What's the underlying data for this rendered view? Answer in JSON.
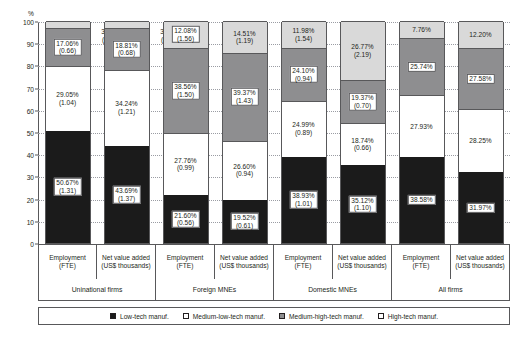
{
  "chart_data": {
    "type": "bar",
    "subtype": "stacked-100-percent",
    "title": "",
    "xlabel": "",
    "ylabel": "%",
    "ylim": [
      0,
      100
    ],
    "yticks": [
      0,
      10,
      20,
      30,
      40,
      50,
      60,
      70,
      80,
      90,
      100
    ],
    "grid": true,
    "legend_position": "bottom",
    "legend": [
      {
        "key": "low",
        "label": "Low-tech manuf.",
        "color": "#1b1b1b"
      },
      {
        "key": "medlow",
        "label": "Medium-low-tech manuf.",
        "color": "#ffffff"
      },
      {
        "key": "medhigh",
        "label": "Medium-high-tech manuf.",
        "color": "#8e8e90"
      },
      {
        "key": "high",
        "label": "High-tech manuf.",
        "color": "#d9d9d9"
      }
    ],
    "groups": [
      {
        "label": "Uninational firms"
      },
      {
        "label": "Foreign MNEs"
      },
      {
        "label": "Domestic MNEs"
      },
      {
        "label": "All firms"
      }
    ],
    "categories": [
      {
        "line1": "Employment",
        "line2": "(FTE)"
      },
      {
        "line1": "Net value added",
        "line2": "(US$ thousands)"
      },
      {
        "line1": "Employment",
        "line2": "(FTE)"
      },
      {
        "line1": "Net value added",
        "line2": "(US$ thousands)"
      },
      {
        "line1": "Employment",
        "line2": "(FTE)"
      },
      {
        "line1": "Net value added",
        "line2": "(US$ thousands)"
      },
      {
        "line1": "Employment",
        "line2": "(FTE)"
      },
      {
        "line1": "Net value added",
        "line2": "(US$ thousands)"
      }
    ],
    "series": [
      {
        "name": "Low-tech manuf.",
        "values": [
          50.67,
          43.69,
          21.6,
          19.52,
          38.93,
          35.12,
          38.58,
          31.97
        ]
      },
      {
        "name": "Medium-low-tech manuf.",
        "values": [
          29.05,
          34.24,
          27.76,
          26.6,
          24.99,
          18.74,
          27.93,
          28.25
        ]
      },
      {
        "name": "Medium-high-tech manuf.",
        "values": [
          17.06,
          18.81,
          38.56,
          39.37,
          24.1,
          19.37,
          25.74,
          27.58
        ]
      },
      {
        "name": "High-tech manuf.",
        "values": [
          3.21,
          3.26,
          12.08,
          14.51,
          11.98,
          26.77,
          7.76,
          12.2
        ]
      }
    ],
    "secondary_series": [
      {
        "name": "Low-tech manuf.",
        "values": [
          1.31,
          1.37,
          0.56,
          0.61,
          1.01,
          1.1,
          null,
          null
        ]
      },
      {
        "name": "Medium-low-tech manuf.",
        "values": [
          1.04,
          1.21,
          0.99,
          0.94,
          0.89,
          0.66,
          null,
          null
        ]
      },
      {
        "name": "Medium-high-tech manuf.",
        "values": [
          0.66,
          0.68,
          1.5,
          1.43,
          0.94,
          0.7,
          null,
          null
        ]
      },
      {
        "name": "High-tech manuf.",
        "values": [
          0.41,
          0.27,
          1.56,
          1.18,
          1.54,
          2.19,
          null,
          null
        ]
      }
    ],
    "bars": [
      {
        "id": "bar-uninational-employment",
        "segments": [
          {
            "key": "low",
            "pct": 50.67,
            "label": "50.67%",
            "sub": "(1.31)",
            "boxed": true,
            "outside": false
          },
          {
            "key": "medlow",
            "pct": 29.05,
            "label": "29.05%",
            "sub": "(1.04)",
            "boxed": false,
            "outside": false
          },
          {
            "key": "medhigh",
            "pct": 17.06,
            "label": "17.06%",
            "sub": "(0.66)",
            "boxed": true,
            "outside": false
          },
          {
            "key": "high",
            "pct": 3.21,
            "label": "3.21%",
            "sub": "(0.41)",
            "boxed": false,
            "outside": true
          }
        ]
      },
      {
        "id": "bar-uninational-netvalueadded",
        "segments": [
          {
            "key": "low",
            "pct": 43.69,
            "label": "43.69%",
            "sub": "(1.37)",
            "boxed": true,
            "outside": false
          },
          {
            "key": "medlow",
            "pct": 34.24,
            "label": "34.24%",
            "sub": "(1.21)",
            "boxed": false,
            "outside": false
          },
          {
            "key": "medhigh",
            "pct": 18.81,
            "label": "18.81%",
            "sub": "(0.68)",
            "boxed": true,
            "outside": false
          },
          {
            "key": "high",
            "pct": 3.26,
            "label": "3.26%",
            "sub": "(0.27)",
            "boxed": false,
            "outside": true
          }
        ]
      },
      {
        "id": "bar-foreignmnes-employment",
        "segments": [
          {
            "key": "low",
            "pct": 21.6,
            "label": "21.60%",
            "sub": "(0.56)",
            "boxed": true,
            "outside": false
          },
          {
            "key": "medlow",
            "pct": 27.76,
            "label": "27.76%",
            "sub": "(0.99)",
            "boxed": false,
            "outside": false
          },
          {
            "key": "medhigh",
            "pct": 38.56,
            "label": "38.56%",
            "sub": "(1.50)",
            "boxed": true,
            "outside": false
          },
          {
            "key": "high",
            "pct": 12.08,
            "label": "12.08%",
            "sub": "(1.56)",
            "boxed": true,
            "outside": false
          }
        ]
      },
      {
        "id": "bar-foreignmnes-netvalueadded",
        "segments": [
          {
            "key": "low",
            "pct": 19.52,
            "label": "19.52%",
            "sub": "(0.61)",
            "boxed": true,
            "outside": false
          },
          {
            "key": "medlow",
            "pct": 26.6,
            "label": "26.60%",
            "sub": "(0.94)",
            "boxed": false,
            "outside": false
          },
          {
            "key": "medhigh",
            "pct": 39.37,
            "label": "39.37%",
            "sub": "(1.43)",
            "boxed": true,
            "outside": false
          },
          {
            "key": "high",
            "pct": 14.51,
            "label": "14.51%",
            "sub": "(1.19)",
            "boxed": false,
            "outside": false
          }
        ]
      },
      {
        "id": "bar-domesticmnes-employment",
        "segments": [
          {
            "key": "low",
            "pct": 38.93,
            "label": "38.93%",
            "sub": "(1.01)",
            "boxed": true,
            "outside": false
          },
          {
            "key": "medlow",
            "pct": 24.99,
            "label": "24.99%",
            "sub": "(0.89)",
            "boxed": false,
            "outside": false
          },
          {
            "key": "medhigh",
            "pct": 24.1,
            "label": "24.10%",
            "sub": "(0.94)",
            "boxed": true,
            "outside": false
          },
          {
            "key": "high",
            "pct": 11.98,
            "label": "11.98%",
            "sub": "(1.54)",
            "boxed": false,
            "outside": false
          }
        ]
      },
      {
        "id": "bar-domesticmnes-netvalueadded",
        "segments": [
          {
            "key": "low",
            "pct": 35.12,
            "label": "35.12%",
            "sub": "(1.10)",
            "boxed": true,
            "outside": false
          },
          {
            "key": "medlow",
            "pct": 18.74,
            "label": "18.74%",
            "sub": "(0.66)",
            "boxed": false,
            "outside": false
          },
          {
            "key": "medhigh",
            "pct": 19.37,
            "label": "19.37%",
            "sub": "(0.70)",
            "boxed": true,
            "outside": false
          },
          {
            "key": "high",
            "pct": 26.77,
            "label": "26.77%",
            "sub": "(2.19)",
            "boxed": false,
            "outside": false
          }
        ]
      },
      {
        "id": "bar-allfirms-employment",
        "segments": [
          {
            "key": "low",
            "pct": 38.58,
            "label": "38.58%",
            "sub": "",
            "boxed": true,
            "outside": false
          },
          {
            "key": "medlow",
            "pct": 27.93,
            "label": "27.93%",
            "sub": "",
            "boxed": false,
            "outside": false
          },
          {
            "key": "medhigh",
            "pct": 25.74,
            "label": "25.74%",
            "sub": "",
            "boxed": true,
            "outside": false
          },
          {
            "key": "high",
            "pct": 7.76,
            "label": "7.76%",
            "sub": "",
            "boxed": false,
            "outside": false
          }
        ]
      },
      {
        "id": "bar-allfirms-netvalueadded",
        "segments": [
          {
            "key": "low",
            "pct": 31.97,
            "label": "31.97%",
            "sub": "",
            "boxed": true,
            "outside": false
          },
          {
            "key": "medlow",
            "pct": 28.25,
            "label": "28.25%",
            "sub": "",
            "boxed": false,
            "outside": false
          },
          {
            "key": "medhigh",
            "pct": 27.58,
            "label": "27.58%",
            "sub": "",
            "boxed": true,
            "outside": false
          },
          {
            "key": "high",
            "pct": 12.2,
            "label": "12.20%",
            "sub": "",
            "boxed": false,
            "outside": false
          }
        ]
      }
    ]
  }
}
